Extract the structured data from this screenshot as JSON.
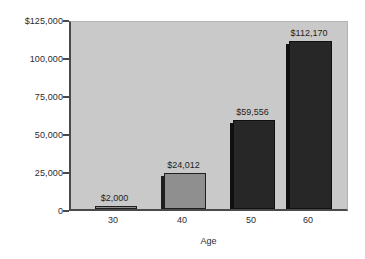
{
  "chart_data": {
    "type": "bar",
    "title": "",
    "xlabel": "Age",
    "ylabel": "",
    "categories": [
      "30",
      "40",
      "50",
      "60"
    ],
    "values": [
      2000,
      24012,
      59556,
      112170
    ],
    "value_labels": [
      "$2,000",
      "$24,012",
      "$59,556",
      "$112,170"
    ],
    "ylim": [
      0,
      125000
    ],
    "ytick_values": [
      125000,
      100000,
      75000,
      50000,
      25000,
      0
    ],
    "ytick_labels": [
      "$125,000",
      "100,000",
      "75,000",
      "50,000",
      "25,000",
      "0"
    ],
    "xtick_labels": [
      "30",
      "40",
      "50",
      "60"
    ],
    "grid": false,
    "legend": null,
    "series": [
      {
        "name": "Value",
        "values": [
          2000,
          24012,
          59556,
          112170
        ]
      }
    ],
    "bar_colors": [
      "#8f8f8f",
      "#8f8f8f",
      "#272727",
      "#272727"
    ],
    "bar_shadow_colors": [
      "#1f1f1f",
      "#1f1f1f",
      "#101010",
      "#101010"
    ]
  },
  "style": {
    "page_background": "#ffffff",
    "plot_background": "#c9c9c9",
    "axis_color": "#4a4a4a",
    "text_color": "#2b2b2b"
  }
}
